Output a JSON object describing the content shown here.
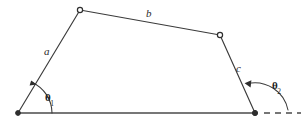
{
  "figure": {
    "name": "four-bar-linkage-quadrilateral",
    "background_color": "#ffffff",
    "line_color": "#3b3b3b",
    "canvas": {
      "width": 307,
      "height": 125
    }
  },
  "vertices": [
    {
      "id": "bottom-left",
      "x": 18,
      "y": 113,
      "marker": "filled-dot"
    },
    {
      "id": "top-left",
      "x": 80,
      "y": 10,
      "marker": "open-circle"
    },
    {
      "id": "top-right",
      "x": 220,
      "y": 35,
      "marker": "open-circle"
    },
    {
      "id": "bottom-right",
      "x": 255,
      "y": 113,
      "marker": "filled-dot"
    }
  ],
  "edges": [
    {
      "id": "side-a",
      "label": "a",
      "from": "bottom-left",
      "to": "top-left"
    },
    {
      "id": "side-b",
      "label": "b",
      "from": "top-left",
      "to": "top-right"
    },
    {
      "id": "side-c",
      "label": "c",
      "from": "top-right",
      "to": "bottom-right"
    },
    {
      "id": "base",
      "label": "",
      "from": "bottom-left",
      "to": "bottom-right"
    }
  ],
  "labels": {
    "side_a": "a",
    "side_b": "b",
    "side_c": "c"
  },
  "angles": {
    "theta1": {
      "symbol": "θ",
      "subscript": "1",
      "at_vertex": "bottom-left",
      "arc_radius": 30,
      "arrow_direction": "counterclockwise-toward-side-a"
    },
    "theta2": {
      "symbol": "θ",
      "subscript": "2",
      "at_vertex": "bottom-right",
      "arc_radius": 33,
      "arrow_direction": "counterclockwise-toward-side-c"
    }
  },
  "dashed_extension": {
    "id": "base-extension",
    "from_x": 262,
    "to_x": 302,
    "y": 113,
    "style": "dashed",
    "dash_count": 3
  }
}
